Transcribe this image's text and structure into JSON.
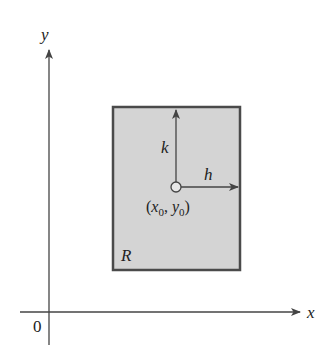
{
  "diagram": {
    "axes": {
      "x_label": "x",
      "y_label": "y",
      "origin_label": "0"
    },
    "region": {
      "label": "R",
      "fill": "#d4d4d4",
      "stroke": "#4a4a4a"
    },
    "point": {
      "label_open": "(",
      "x_sym": "x",
      "x_sub": "0",
      "sep": ", ",
      "y_sym": "y",
      "y_sub": "0",
      "label_close": ")"
    },
    "increments": {
      "horizontal": "h",
      "vertical": "k"
    }
  }
}
